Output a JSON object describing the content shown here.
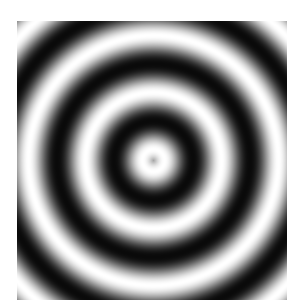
{
  "image": {
    "description": "Concentric grayscale sinusoidal rings",
    "background": "#ffffff",
    "box": {
      "left": 17,
      "top": 21,
      "width": 270,
      "height": 279
    },
    "center": {
      "x": 153,
      "y": 160
    },
    "period_px": 57,
    "phase_white_radius_px": 11,
    "white_color": "#ffffff",
    "dark_color": "#0a0a0a"
  }
}
